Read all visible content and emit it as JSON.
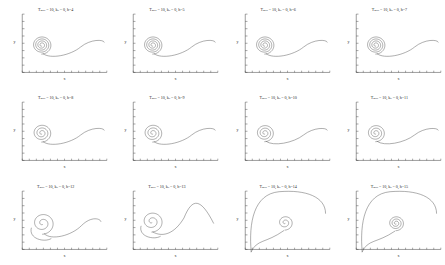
{
  "figure": {
    "type": "multi-panel-phase-portrait",
    "rows": 3,
    "cols": 4,
    "background_color": "#ffffff",
    "curve_color": "#4a4a4a",
    "axis_color": "#3a3a3a"
  },
  "axes": {
    "xlabel": "x",
    "ylabel": "y",
    "x_tick_count": 12,
    "y_tick_count": 8,
    "grid": false
  },
  "chart_data": {
    "type": "line",
    "xlabel": "x",
    "ylabel": "y",
    "grid": false,
    "legend": "none",
    "shared_params": {
      "T_max": 10,
      "k_0": 0
    },
    "panels": [
      {
        "index": 0,
        "title": "T_max = 10, k_0 = 0, h=4",
        "h": 4,
        "T_max": 10,
        "k_0": 0,
        "description": "tight multi-turn spiral sink at left with outgoing S-shaped tail to the right",
        "spiral_turns": 4,
        "spiral_center": [
          0.23,
          0.47
        ],
        "spiral_outer_radius": 0.115,
        "tail_end": [
          0.97,
          0.52
        ]
      },
      {
        "index": 1,
        "title": "T_max = 10, k_0 = 0, h=5",
        "h": 5,
        "T_max": 10,
        "k_0": 0,
        "description": "tight multi-turn spiral sink at left with outgoing S-shaped tail to the right",
        "spiral_turns": 4,
        "spiral_center": [
          0.23,
          0.47
        ],
        "spiral_outer_radius": 0.115,
        "tail_end": [
          0.97,
          0.52
        ]
      },
      {
        "index": 2,
        "title": "T_max = 10, k_0 = 0, h=6",
        "h": 6,
        "T_max": 10,
        "k_0": 0,
        "description": "tight multi-turn spiral sink at left with outgoing S-shaped tail to the right",
        "spiral_turns": 4,
        "spiral_center": [
          0.23,
          0.47
        ],
        "spiral_outer_radius": 0.115,
        "tail_end": [
          0.97,
          0.52
        ]
      },
      {
        "index": 3,
        "title": "T_max = 10, k_0 = 0, h=7",
        "h": 7,
        "T_max": 10,
        "k_0": 0,
        "description": "tight multi-turn spiral sink at left with outgoing S-shaped tail to the right",
        "spiral_turns": 4,
        "spiral_center": [
          0.23,
          0.47
        ],
        "spiral_outer_radius": 0.115,
        "tail_end": [
          0.97,
          0.52
        ]
      },
      {
        "index": 4,
        "title": "T_max = 10, k_0 = 0, h=8",
        "h": 8,
        "T_max": 10,
        "k_0": 0,
        "description": "spiral sink with slightly fewer turns, S-shaped outgoing tail",
        "spiral_turns": 3,
        "spiral_center": [
          0.23,
          0.47
        ],
        "spiral_outer_radius": 0.115,
        "tail_end": [
          0.97,
          0.52
        ]
      },
      {
        "index": 5,
        "title": "T_max = 10, k_0 = 0, h=9",
        "h": 9,
        "T_max": 10,
        "k_0": 0,
        "description": "spiral sink with slightly fewer turns, S-shaped outgoing tail",
        "spiral_turns": 3,
        "spiral_center": [
          0.23,
          0.47
        ],
        "spiral_outer_radius": 0.115,
        "tail_end": [
          0.97,
          0.52
        ]
      },
      {
        "index": 6,
        "title": "T_max = 10, k_0 = 0, h=10",
        "h": 10,
        "T_max": 10,
        "k_0": 0,
        "description": "spiral sink with fewer turns, S-shaped outgoing tail",
        "spiral_turns": 3,
        "spiral_center": [
          0.23,
          0.47
        ],
        "spiral_outer_radius": 0.11,
        "tail_end": [
          0.97,
          0.52
        ]
      },
      {
        "index": 7,
        "title": "T_max = 10, k_0 = 0, h=11",
        "h": 11,
        "T_max": 10,
        "k_0": 0,
        "description": "spiral sink with fewer turns, S-shaped outgoing tail",
        "spiral_turns": 3,
        "spiral_center": [
          0.23,
          0.47
        ],
        "spiral_outer_radius": 0.11,
        "tail_end": [
          0.97,
          0.52
        ]
      },
      {
        "index": 8,
        "title": "T_max = 10, k_0 = 0, h=12",
        "h": 12,
        "T_max": 10,
        "k_0": 0,
        "description": "single large near-circular loop at left plus shallow S tail to the right",
        "spiral_turns": 2,
        "spiral_center": [
          0.24,
          0.45
        ],
        "spiral_outer_radius": 0.14,
        "tail_end": [
          0.93,
          0.48
        ]
      },
      {
        "index": 9,
        "title": "T_max = 10, k_0 = 0, h=13",
        "h": 13,
        "T_max": 10,
        "k_0": 0,
        "description": "single loop at far left with a large rising hump crest on the right",
        "spiral_turns": 2,
        "spiral_center": [
          0.22,
          0.48
        ],
        "spiral_outer_radius": 0.135,
        "tail_end": [
          0.95,
          0.45
        ]
      },
      {
        "index": 10,
        "title": "T_max = 10, k_0 = 0, h=14",
        "h": 14,
        "T_max": 10,
        "k_0": 0,
        "description": "tall broad arc over the whole panel with a small circular loop near the centre",
        "spiral_turns": 2,
        "spiral_center": [
          0.47,
          0.46
        ],
        "spiral_outer_radius": 0.095,
        "tail_end": [
          0.95,
          0.62
        ]
      },
      {
        "index": 11,
        "title": "T_max = 10, k_0 = 0, h=15",
        "h": 15,
        "T_max": 10,
        "k_0": 0,
        "description": "tall broad arc with a small double loop near the centre",
        "spiral_turns": 3,
        "spiral_center": [
          0.47,
          0.45
        ],
        "spiral_outer_radius": 0.095,
        "tail_end": [
          0.95,
          0.62
        ]
      }
    ]
  }
}
